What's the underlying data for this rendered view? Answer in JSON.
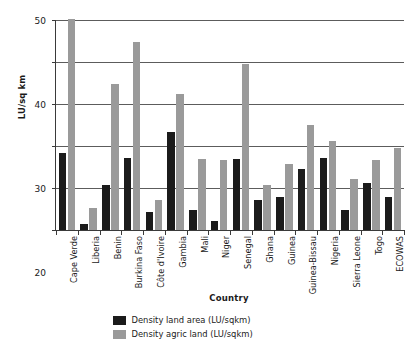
{
  "chart_data": {
    "type": "bar",
    "title": "",
    "xlabel": "Country",
    "ylabel": "LU/sq km",
    "ylim": [
      0,
      50
    ],
    "yticks": [
      0,
      10,
      20,
      30,
      40,
      50
    ],
    "ytick_labels": [
      "0",
      "10",
      "20",
      "30",
      "40",
      "50"
    ],
    "grid": true,
    "legend_position": "bottom",
    "categories": [
      "Cape Verde",
      "Liberia",
      "Benin",
      "Burkina Faso",
      "Côte d'Ivoire",
      "Gambia",
      "Mali",
      "Niger",
      "Senegal",
      "Ghana",
      "Guinea",
      "Guinea-Bissau",
      "Nigeria",
      "Sierra Leone",
      "Togo",
      "ECOWAS"
    ],
    "series": [
      {
        "name": "Density land area (LU/sqkm)",
        "color": "#1b1b1b",
        "values": [
          18.3,
          1.4,
          10.6,
          17.1,
          4.3,
          23.3,
          4.8,
          2.2,
          16.9,
          7.1,
          7.9,
          14.5,
          17.1,
          4.8,
          11.2,
          7.8
        ]
      },
      {
        "name": "Density agric land (LU/sqkm)",
        "color": "#9a9a9a",
        "values": [
          50.2,
          5.2,
          34.7,
          44.8,
          7.1,
          32.5,
          16.8,
          16.6,
          39.5,
          10.8,
          15.7,
          25.1,
          21.3,
          12.2,
          16.7,
          19.6
        ]
      }
    ]
  },
  "legend": {
    "items": [
      {
        "label": "Density land area (LU/sqkm)",
        "swatch": "series-a"
      },
      {
        "label": "Density agric land (LU/sqkm)",
        "swatch": "series-b"
      }
    ]
  },
  "axes": {
    "y_title": "LU/sq km",
    "x_title": "Country"
  }
}
